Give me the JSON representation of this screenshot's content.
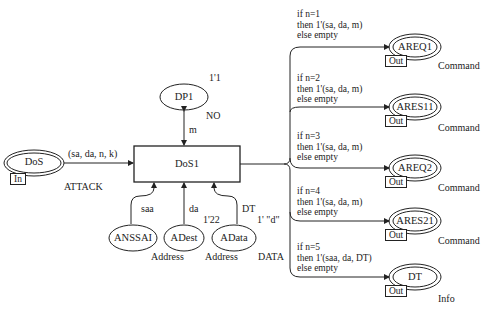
{
  "diagram": {
    "transition": {
      "label": "DoS1"
    },
    "places": {
      "dos": {
        "label": "DoS",
        "port": "In",
        "type": "ATTACK"
      },
      "dp1": {
        "label": "DP1",
        "type": "NO",
        "marking": "1'1"
      },
      "anssai": {
        "label": "ANSSAI"
      },
      "adest": {
        "label": "ADest",
        "type": "Address",
        "marking": "1'22"
      },
      "adata": {
        "label": "AData",
        "type": "Address",
        "marking": "1' \"d\""
      },
      "adata_type": "DATA"
    },
    "arcs": {
      "dos_in": "(sa, da, n, k)",
      "dp1": "m",
      "anssai": "saa",
      "adest": "da",
      "adata": "DT"
    },
    "outputs": [
      {
        "label": "AREQ1",
        "port": "Out",
        "type": "Command",
        "cond": [
          "if n=1",
          "then 1'(sa, da, m)",
          "else empty"
        ]
      },
      {
        "label": "ARES11",
        "port": "Out",
        "type": "Command",
        "cond": [
          "if n=2",
          "then 1'(sa, da, m)",
          "else empty"
        ]
      },
      {
        "label": "AREQ2",
        "port": "Out",
        "type": "Command",
        "cond": [
          "if n=3",
          "then 1'(sa, da, m)",
          "else empty"
        ]
      },
      {
        "label": "ARES21",
        "port": "Out",
        "type": "Command",
        "cond": [
          "if n=4",
          "then 1'(sa, da, m)",
          "else empty"
        ]
      },
      {
        "label": "DT",
        "port": "Out",
        "type": "Info",
        "cond": [
          "if n=5",
          "then 1'(saa, da, DT)",
          "else empty"
        ]
      }
    ]
  }
}
